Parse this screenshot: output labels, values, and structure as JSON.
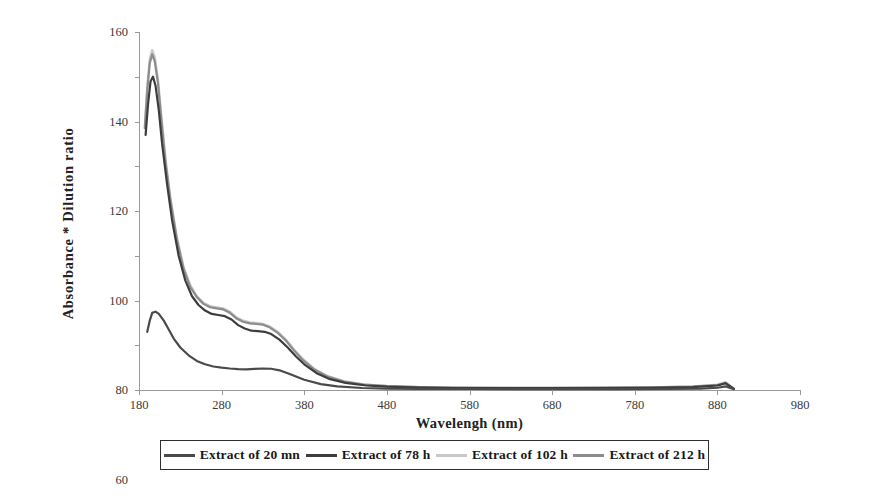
{
  "chart_data": {
    "type": "line",
    "title": "",
    "xlabel": "Wavelengh (nm)",
    "ylabel": "Absorbance * Dilution ratio",
    "xlim": [
      180,
      980
    ],
    "ylim": [
      0,
      160
    ],
    "xticks": [
      180,
      280,
      380,
      480,
      580,
      680,
      780,
      880,
      980
    ],
    "yticks": [
      0,
      20,
      40,
      60,
      80,
      100,
      120,
      140,
      160
    ],
    "grid": false,
    "legend_position": "bottom",
    "series": [
      {
        "name": "Extract of 20 mn",
        "color": "#4a4a4a",
        "x": [
          190,
          193,
          196,
          200,
          204,
          210,
          216,
          222,
          230,
          240,
          250,
          260,
          270,
          280,
          290,
          300,
          310,
          320,
          330,
          340,
          350,
          360,
          370,
          380,
          400,
          420,
          450,
          480,
          520,
          580,
          640,
          700,
          760,
          820,
          860,
          880,
          890,
          900
        ],
        "y": [
          26,
          31,
          34.5,
          35,
          34,
          31,
          27,
          23,
          19,
          15.5,
          13,
          11.5,
          10.5,
          10,
          9.6,
          9.3,
          9.2,
          9.4,
          9.6,
          9.5,
          8.8,
          7.5,
          6.0,
          4.6,
          2.6,
          1.6,
          0.9,
          0.6,
          0.5,
          0.45,
          0.4,
          0.4,
          0.4,
          0.45,
          0.6,
          1.0,
          1.6,
          0.4
        ]
      },
      {
        "name": "Extract of 78 h",
        "color": "#3d3d3d",
        "x": [
          188,
          191,
          194,
          197,
          200,
          204,
          208,
          214,
          220,
          228,
          236,
          244,
          252,
          260,
          268,
          276,
          284,
          292,
          300,
          308,
          316,
          324,
          332,
          340,
          350,
          360,
          370,
          380,
          395,
          410,
          430,
          455,
          480,
          520,
          560,
          620,
          680,
          740,
          800,
          850,
          880,
          890,
          900
        ],
        "y": [
          114,
          128,
          138,
          140,
          136,
          125,
          110,
          92,
          76,
          60,
          49,
          42,
          38,
          35.5,
          34,
          33.5,
          33,
          31.5,
          29,
          27.5,
          26.5,
          26.3,
          26,
          25,
          22.5,
          19,
          15,
          11.5,
          7.5,
          5.0,
          3.2,
          2.0,
          1.5,
          1.1,
          0.9,
          0.8,
          0.8,
          0.9,
          1.0,
          1.3,
          2.0,
          3.0,
          0.5
        ]
      },
      {
        "name": "Extract of 102 h",
        "color": "#c9c9c9",
        "x": [
          187,
          190,
          193,
          196,
          199,
          203,
          207,
          212,
          218,
          226,
          234,
          242,
          250,
          258,
          266,
          274,
          282,
          290,
          298,
          306,
          314,
          322,
          330,
          338,
          348,
          358,
          368,
          378,
          392,
          408,
          428,
          452,
          480,
          520,
          560,
          620,
          680,
          740,
          800,
          850,
          880,
          890,
          900
        ],
        "y": [
          118,
          136,
          148,
          152,
          149,
          139,
          123,
          104,
          86,
          68,
          55,
          47,
          42,
          39,
          37.5,
          37,
          36.5,
          35,
          32.5,
          31,
          30.2,
          30,
          29.6,
          28.5,
          26,
          22.5,
          18,
          14,
          9.5,
          6.3,
          4.0,
          2.5,
          1.8,
          1.3,
          1.1,
          1.0,
          1.0,
          1.1,
          1.2,
          1.6,
          2.4,
          3.5,
          0.6
        ]
      },
      {
        "name": "Extract of 212 h",
        "color": "#8c8c8c",
        "x": [
          187,
          190,
          193,
          196,
          199,
          203,
          207,
          212,
          218,
          226,
          234,
          242,
          250,
          258,
          266,
          274,
          282,
          290,
          298,
          306,
          314,
          322,
          330,
          338,
          348,
          358,
          368,
          378,
          392,
          408,
          428,
          452,
          480,
          520,
          560,
          620,
          680,
          740,
          800,
          850,
          880,
          890,
          900
        ],
        "y": [
          117,
          134,
          146,
          150,
          147,
          137,
          121,
          102,
          85,
          67,
          54,
          46,
          41.5,
          38.5,
          37,
          36.5,
          36,
          34.5,
          32,
          30.5,
          29.8,
          29.5,
          29.2,
          28,
          25.5,
          22,
          17.5,
          13.5,
          9.2,
          6.0,
          3.8,
          2.4,
          1.7,
          1.25,
          1.05,
          0.95,
          0.95,
          1.05,
          1.15,
          1.5,
          2.2,
          3.2,
          0.55
        ]
      }
    ]
  },
  "legend": {
    "items": [
      {
        "label": "Extract of 20 mn"
      },
      {
        "label": "Extract of 78 h"
      },
      {
        "label": "Extract of 102 h"
      },
      {
        "label": "Extract of 212 h"
      }
    ]
  }
}
